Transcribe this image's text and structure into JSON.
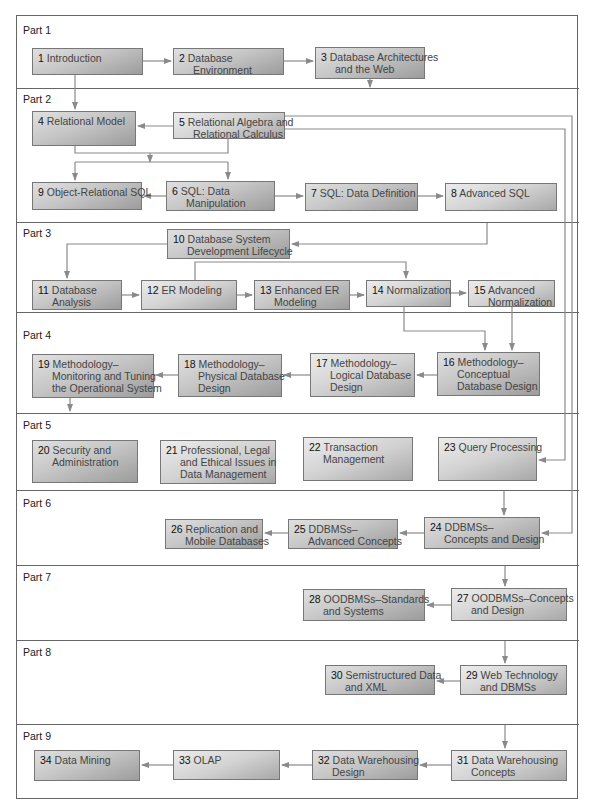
{
  "diagram": {
    "type": "chapter-dependency-flowchart",
    "colors": {
      "box_light": "#e0e0e0",
      "box_dark": "#9c9c9c",
      "line": "#888888",
      "frame": "#666666",
      "text": "#444444"
    },
    "parts": [
      {
        "label": "Part 1"
      },
      {
        "label": "Part 2"
      },
      {
        "label": "Part 3"
      },
      {
        "label": "Part 4"
      },
      {
        "label": "Part 5"
      },
      {
        "label": "Part 6"
      },
      {
        "label": "Part 7"
      },
      {
        "label": "Part 8"
      },
      {
        "label": "Part 9"
      }
    ],
    "chapters": {
      "c1": {
        "num": "1",
        "line1": "Introduction",
        "line2": ""
      },
      "c2": {
        "num": "2",
        "line1": "Database",
        "line2": "Environment"
      },
      "c3": {
        "num": "3",
        "line1": "Database Architectures",
        "line2": "and the Web"
      },
      "c4": {
        "num": "4",
        "line1": "Relational Model",
        "line2": ""
      },
      "c5": {
        "num": "5",
        "line1": "Relational Algebra and",
        "line2": "Relational Calculus"
      },
      "c6": {
        "num": "6",
        "line1": "SQL: Data",
        "line2": "Manipulation"
      },
      "c7": {
        "num": "7",
        "line1": "SQL: Data Definition",
        "line2": ""
      },
      "c8": {
        "num": "8",
        "line1": "Advanced SQL",
        "line2": ""
      },
      "c9": {
        "num": "9",
        "line1": "Object-Relational SQL",
        "line2": ""
      },
      "c10": {
        "num": "10",
        "line1": "Database System",
        "line2": "Development Lifecycle"
      },
      "c11": {
        "num": "11",
        "line1": "Database",
        "line2": "Analysis"
      },
      "c12": {
        "num": "12",
        "line1": "ER Modeling",
        "line2": ""
      },
      "c13": {
        "num": "13",
        "line1": "Enhanced ER",
        "line2": "Modeling"
      },
      "c14": {
        "num": "14",
        "line1": "Normalization",
        "line2": ""
      },
      "c15": {
        "num": "15",
        "line1": "Advanced",
        "line2": "Normalization"
      },
      "c16": {
        "num": "16",
        "line1": "Methodology–",
        "line2": "Conceptual",
        "line3": "Database Design"
      },
      "c17": {
        "num": "17",
        "line1": "Methodology–",
        "line2": "Logical Database",
        "line3": "Design"
      },
      "c18": {
        "num": "18",
        "line1": "Methodology–",
        "line2": "Physical Database",
        "line3": "Design"
      },
      "c19": {
        "num": "19",
        "line1": "Methodology–",
        "line2": "Monitoring and Tuning",
        "line3": "the Operational System"
      },
      "c20": {
        "num": "20",
        "line1": "Security and",
        "line2": "Administration"
      },
      "c21": {
        "num": "21",
        "line1": "Professional, Legal",
        "line2": "and Ethical Issues in",
        "line3": "Data Management"
      },
      "c22": {
        "num": "22",
        "line1": "Transaction",
        "line2": "Management"
      },
      "c23": {
        "num": "23",
        "line1": "Query Processing",
        "line2": ""
      },
      "c24": {
        "num": "24",
        "line1": "DDBMSs–",
        "line2": "Concepts and Design"
      },
      "c25": {
        "num": "25",
        "line1": "DDBMSs–",
        "line2": "Advanced Concepts"
      },
      "c26": {
        "num": "26",
        "line1": "Replication and",
        "line2": "Mobile Databases"
      },
      "c27": {
        "num": "27",
        "line1": "OODBMSs–Concepts",
        "line2": "and Design"
      },
      "c28": {
        "num": "28",
        "line1": "OODBMSs–Standards",
        "line2": "and Systems"
      },
      "c29": {
        "num": "29",
        "line1": "Web Technology",
        "line2": "and DBMSs"
      },
      "c30": {
        "num": "30",
        "line1": "Semistructured Data",
        "line2": "and XML"
      },
      "c31": {
        "num": "31",
        "line1": "Data Warehousing",
        "line2": "Concepts"
      },
      "c32": {
        "num": "32",
        "line1": "Data Warehousing",
        "line2": "Design"
      },
      "c33": {
        "num": "33",
        "line1": "OLAP",
        "line2": ""
      },
      "c34": {
        "num": "34",
        "line1": "Data Mining",
        "line2": ""
      }
    },
    "edges": [
      [
        "1",
        "2"
      ],
      [
        "2",
        "3"
      ],
      [
        "1",
        "4"
      ],
      [
        "3",
        "Part 2"
      ],
      [
        "5",
        "4"
      ],
      [
        "4+5",
        "6"
      ],
      [
        "4+5",
        "9"
      ],
      [
        "6",
        "9"
      ],
      [
        "6",
        "7"
      ],
      [
        "7",
        "8"
      ],
      [
        "Part 2",
        "10"
      ],
      [
        "10",
        "11"
      ],
      [
        "11",
        "12"
      ],
      [
        "12",
        "13"
      ],
      [
        "12",
        "14"
      ],
      [
        "13",
        "14"
      ],
      [
        "14",
        "15"
      ],
      [
        "14",
        "16"
      ],
      [
        "15",
        "16"
      ],
      [
        "16",
        "17"
      ],
      [
        "17",
        "18"
      ],
      [
        "18",
        "19"
      ],
      [
        "19",
        "Part 5"
      ],
      [
        "5",
        "23"
      ],
      [
        "5",
        "24"
      ],
      [
        "Part 5",
        "24"
      ],
      [
        "24",
        "25"
      ],
      [
        "25",
        "26"
      ],
      [
        "Part 6",
        "27"
      ],
      [
        "27",
        "28"
      ],
      [
        "Part 7",
        "29"
      ],
      [
        "29",
        "30"
      ],
      [
        "Part 8",
        "31"
      ],
      [
        "31",
        "32"
      ],
      [
        "32",
        "33"
      ],
      [
        "33",
        "34"
      ]
    ]
  }
}
